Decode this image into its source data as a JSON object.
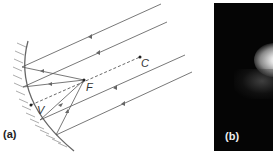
{
  "figure": {
    "panel_a": {
      "label": "(a)",
      "points": {
        "focus": "F",
        "center": "C",
        "vertex": "V"
      }
    },
    "panel_b": {
      "label": "(b)"
    }
  },
  "colors": {
    "line": "#555555",
    "photo_bg": "#050505"
  }
}
